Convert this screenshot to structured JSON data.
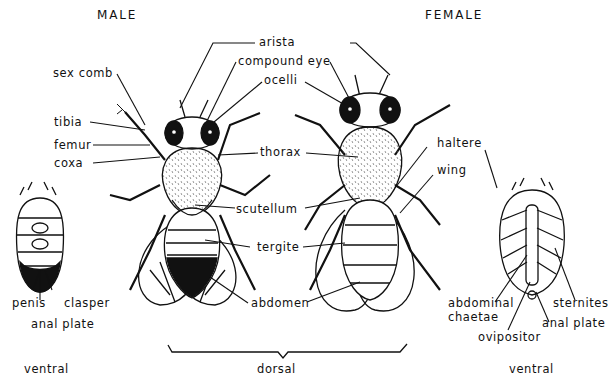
{
  "headings": {
    "male": "MALE",
    "female": "FEMALE"
  },
  "views": {
    "ventral_left": "ventral",
    "dorsal": "dorsal",
    "ventral_right": "ventral"
  },
  "labels": {
    "arista": "arista",
    "compound_eye": "compound eye",
    "ocelli": "ocelli",
    "sex_comb": "sex comb",
    "tibia": "tibia",
    "femur": "femur",
    "coxa": "coxa",
    "thorax": "thorax",
    "haltere": "haltere",
    "wing": "wing",
    "scutellum": "scutellum",
    "tergite": "tergite",
    "abdomen": "abdomen",
    "penis": "penis",
    "clasper": "clasper",
    "anal_plate_male": "anal plate",
    "abdominal_chaetae_1": "abdominal",
    "abdominal_chaetae_2": "chaetae",
    "sternites": "sternites",
    "anal_plate_female": "anal plate",
    "ovipositor": "ovipositor"
  },
  "colors": {
    "ink": "#111111",
    "background": "#ffffff"
  }
}
